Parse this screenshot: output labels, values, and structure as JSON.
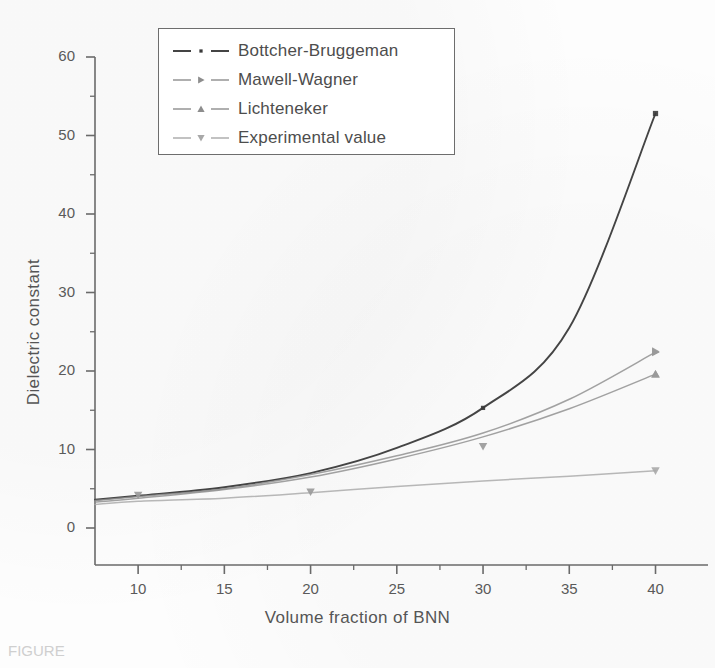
{
  "chart_data": {
    "type": "line",
    "title": "",
    "xlabel": "Volume fraction of BNN",
    "ylabel": "Dielectric constant",
    "xlim": [
      7.5,
      42
    ],
    "ylim": [
      0,
      60
    ],
    "xticks": [
      10,
      15,
      20,
      25,
      30,
      35,
      40
    ],
    "yticks": [
      0,
      10,
      20,
      30,
      40,
      50,
      60
    ],
    "xminor": [
      12.5,
      17.5,
      22.5,
      27.5,
      32.5,
      37.5
    ],
    "yminor": [
      5,
      15,
      25,
      35,
      45,
      55
    ],
    "grid": false,
    "legend_position": "upper-left",
    "x": [
      7.5,
      10,
      15,
      20,
      25,
      30,
      35,
      40
    ],
    "series": [
      {
        "name": "Bottcher-Bruggeman",
        "color": "#3a3a3a",
        "marker": "square",
        "linestyle": "dash-dot",
        "values": [
          3.6,
          4.1,
          5.2,
          7.0,
          10.2,
          15.3,
          25.5,
          52.8
        ]
      },
      {
        "name": "Mawell-Wagner",
        "color": "#8d8d8d",
        "marker": "triangle-right",
        "linestyle": "dash-dot",
        "values": [
          3.5,
          4.0,
          5.0,
          6.8,
          9.2,
          12.1,
          16.4,
          22.4
        ]
      },
      {
        "name": "Lichteneker",
        "color": "#8d8d8d",
        "marker": "triangle-up",
        "linestyle": "dash-dot",
        "values": [
          3.3,
          3.8,
          4.9,
          6.5,
          8.8,
          11.6,
          15.2,
          19.6
        ]
      },
      {
        "name": "Experimental value",
        "color": "#a8a8a8",
        "marker": "triangle-down",
        "linestyle": "dash-dot",
        "values": [
          3.0,
          3.4,
          3.8,
          4.5,
          5.3,
          6.0,
          6.6,
          7.3
        ]
      }
    ],
    "experimental_points": [
      {
        "x": 10,
        "y": 4.2,
        "marker": "triangle-down"
      },
      {
        "x": 20,
        "y": 4.6,
        "marker": "triangle-down"
      },
      {
        "x": 30,
        "y": 10.4,
        "marker": "triangle-down"
      },
      {
        "x": 30,
        "y": 15.3,
        "marker": "square"
      },
      {
        "x": 40,
        "y": 22.5,
        "marker": "triangle-right"
      },
      {
        "x": 40,
        "y": 19.6,
        "marker": "triangle-up"
      }
    ]
  },
  "legend": {
    "items": [
      {
        "label": "Bottcher-Bruggeman",
        "marker": "square",
        "color": "#3a3a3a"
      },
      {
        "label": "Mawell-Wagner",
        "marker": "triangle-right",
        "color": "#8d8d8d"
      },
      {
        "label": "Lichteneker",
        "marker": "triangle-up",
        "color": "#8d8d8d"
      },
      {
        "label": "Experimental value",
        "marker": "triangle-down",
        "color": "#a8a8a8"
      }
    ]
  },
  "axes": {
    "x_title": "Volume fraction of BNN",
    "y_title": "Dielectric constant",
    "x_tick_labels": [
      "10",
      "15",
      "20",
      "25",
      "30",
      "35",
      "40"
    ],
    "y_tick_labels": [
      "0",
      "10",
      "20",
      "30",
      "40",
      "50",
      "60"
    ]
  },
  "caption": {
    "text": "FIGURE"
  }
}
